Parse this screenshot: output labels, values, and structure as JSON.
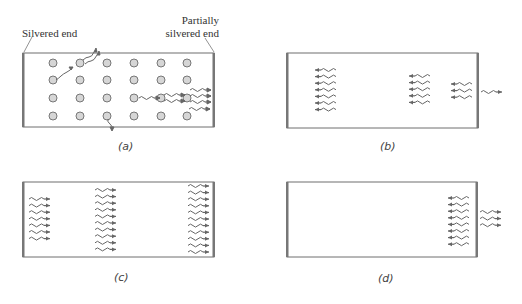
{
  "figure": {
    "labels": {
      "silvered_end": "Silvered end",
      "partially_line1": "Partially",
      "partially_line2": "silvered end"
    },
    "captions": {
      "a": "(a)",
      "b": "(b)",
      "c": "(c)",
      "d": "(d)"
    },
    "colors": {
      "frame": "#6e6e6e",
      "mirror": "#777777",
      "atom_fill": "#d6d6d6",
      "atom_stroke": "#777777",
      "wave": "#666666",
      "text": "#333333"
    },
    "panels": {
      "a": {
        "rect": [
          23,
          53,
          214,
          127
        ],
        "atom_cols": [
          53,
          80,
          107,
          134,
          161,
          187
        ],
        "atom_rows": [
          63,
          80,
          98,
          116
        ]
      },
      "b": {
        "rect": [
          287,
          53,
          478,
          128
        ]
      },
      "c": {
        "rect": [
          23,
          182,
          214,
          257
        ]
      },
      "d": {
        "rect": [
          287,
          182,
          477,
          257
        ]
      }
    }
  }
}
